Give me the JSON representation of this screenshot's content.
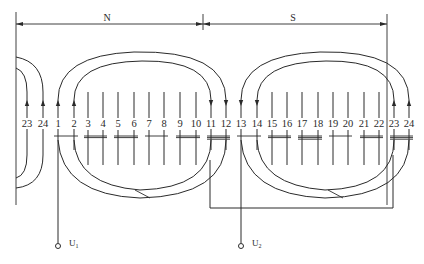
{
  "diagram": {
    "type": "stator-winding-expanded-diagram",
    "poles": [
      {
        "label": "N",
        "x_start": 16,
        "x_end": 203
      },
      {
        "label": "S",
        "x_start": 203,
        "x_end": 387
      }
    ],
    "slots": [
      {
        "n": "23",
        "x": 27,
        "arrow": "up",
        "partial": true
      },
      {
        "n": "24",
        "x": 43,
        "arrow": "up",
        "partial": true
      },
      {
        "n": "1",
        "x": 58,
        "arrow": "up"
      },
      {
        "n": "2",
        "x": 74,
        "arrow": "up"
      },
      {
        "n": "3",
        "x": 88
      },
      {
        "n": "4",
        "x": 103
      },
      {
        "n": "5",
        "x": 118
      },
      {
        "n": "6",
        "x": 134
      },
      {
        "n": "7",
        "x": 149
      },
      {
        "n": "8",
        "x": 164
      },
      {
        "n": "9",
        "x": 180
      },
      {
        "n": "10",
        "x": 196
      },
      {
        "n": "11",
        "x": 211,
        "arrow": "down"
      },
      {
        "n": "12",
        "x": 226,
        "arrow": "down"
      },
      {
        "n": "13",
        "x": 241,
        "arrow": "down"
      },
      {
        "n": "14",
        "x": 257,
        "arrow": "down"
      },
      {
        "n": "15",
        "x": 272
      },
      {
        "n": "16",
        "x": 287
      },
      {
        "n": "17",
        "x": 302
      },
      {
        "n": "18",
        "x": 318
      },
      {
        "n": "19",
        "x": 333
      },
      {
        "n": "20",
        "x": 348
      },
      {
        "n": "21",
        "x": 364
      },
      {
        "n": "22",
        "x": 379
      },
      {
        "n": "23",
        "x": 394,
        "arrow": "up"
      },
      {
        "n": "24",
        "x": 409,
        "arrow": "up"
      }
    ],
    "terminals": [
      {
        "label": "U",
        "sub": "1",
        "x": 58
      },
      {
        "label": "U",
        "sub": "2",
        "x": 241
      }
    ],
    "colors": {
      "line": "#2a2a2a",
      "background": "#ffffff"
    }
  }
}
